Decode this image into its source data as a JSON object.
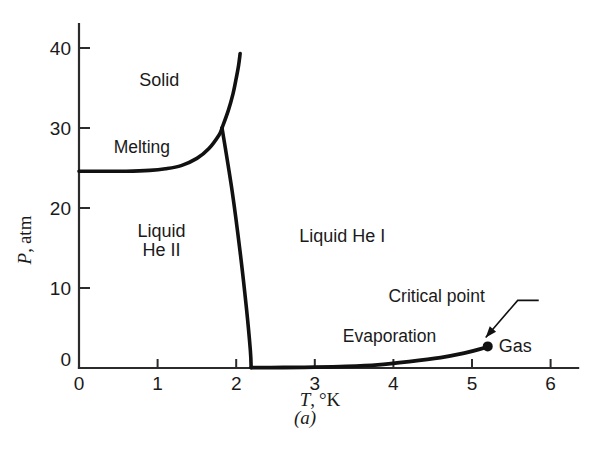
{
  "figure": {
    "panel_label": "(a)",
    "axis_color": "#2b2b2b",
    "curve_color": "#111111"
  },
  "chart_data": {
    "type": "line",
    "title": "",
    "subtitle": "",
    "xlabel_parts": {
      "symbol": "T",
      "comma": ",",
      "unit": "°K"
    },
    "xlabel": "T, °K",
    "ylabel_parts": {
      "symbol": "P",
      "comma": ",",
      "unit": "atm"
    },
    "ylabel": "P, atm",
    "xlim": [
      0,
      6.35
    ],
    "ylim": [
      0,
      43
    ],
    "xticks": [
      0,
      1,
      2,
      3,
      4,
      5,
      6
    ],
    "xticklabels": [
      "0",
      "1",
      "2",
      "3",
      "4",
      "5",
      "6"
    ],
    "yticks": [
      0,
      10,
      20,
      30,
      40
    ],
    "yticklabels": [
      "0",
      "10",
      "20",
      "30",
      "40"
    ],
    "grid": false,
    "legend": "none",
    "series": [
      {
        "name": "Melting line (solid–liquid He II / He I)",
        "points": [
          [
            0.0,
            24.6
          ],
          [
            0.3,
            24.6
          ],
          [
            0.6,
            24.6
          ],
          [
            0.9,
            24.7
          ],
          [
            1.1,
            24.9
          ],
          [
            1.3,
            25.3
          ],
          [
            1.5,
            26.2
          ],
          [
            1.65,
            27.4
          ],
          [
            1.78,
            29.1
          ],
          [
            1.82,
            30.0
          ]
        ]
      },
      {
        "name": "Solid–liquid He I boundary",
        "points": [
          [
            1.82,
            30.0
          ],
          [
            1.9,
            32.2
          ],
          [
            1.96,
            34.3
          ],
          [
            2.0,
            36.2
          ],
          [
            2.03,
            37.8
          ],
          [
            2.05,
            39.3
          ]
        ]
      },
      {
        "name": "Lambda line (He II – He I)",
        "points": [
          [
            1.82,
            30.0
          ],
          [
            1.95,
            22.0
          ],
          [
            2.05,
            14.5
          ],
          [
            2.13,
            7.5
          ],
          [
            2.18,
            2.2
          ],
          [
            2.19,
            0.05
          ]
        ]
      },
      {
        "name": "Evaporation (vaporization) curve",
        "points": [
          [
            2.19,
            0.05
          ],
          [
            2.6,
            0.06
          ],
          [
            3.0,
            0.1
          ],
          [
            3.4,
            0.2
          ],
          [
            3.8,
            0.4
          ],
          [
            4.2,
            0.8
          ],
          [
            4.6,
            1.3
          ],
          [
            4.9,
            1.85
          ],
          [
            5.1,
            2.35
          ],
          [
            5.2,
            2.7
          ]
        ]
      }
    ],
    "annotations": [
      {
        "name": "solid-region-label",
        "text": "Solid",
        "x": 1.02,
        "y": 35.3
      },
      {
        "name": "melting-curve-label",
        "text": "Melting",
        "x": 0.8,
        "y": 26.9
      },
      {
        "name": "liquid-he2-region-label-1",
        "text": "Liquid",
        "x": 1.05,
        "y": 16.4
      },
      {
        "name": "liquid-he2-region-label-2",
        "text": "He II",
        "x": 1.05,
        "y": 14.0
      },
      {
        "name": "liquid-he1-region-label",
        "text": "Liquid  He I",
        "x": 3.35,
        "y": 15.7
      },
      {
        "name": "evaporation-curve-label",
        "text": "Evaporation",
        "x": 3.95,
        "y": 3.3
      },
      {
        "name": "critical-point-label",
        "text": "Critical point",
        "x": 4.55,
        "y": 8.2
      },
      {
        "name": "gas-region-label",
        "text": "Gas",
        "x": 5.55,
        "y": 2.0
      }
    ],
    "markers": [
      {
        "name": "critical-point",
        "x": 5.2,
        "y": 2.7,
        "label": "Critical point",
        "radius": 5
      }
    ]
  }
}
